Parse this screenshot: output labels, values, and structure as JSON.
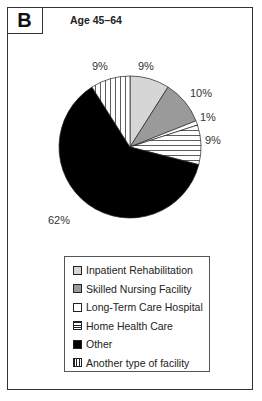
{
  "panel": {
    "label": "B",
    "title": "Age 45–64"
  },
  "chart_data": {
    "type": "pie",
    "title": "Age 45–64",
    "categories": [
      "Inpatient Rehabilitation",
      "Skilled Nursing Facility",
      "Long-Term Care Hospital",
      "Home Health Care",
      "Other",
      "Another type of facility"
    ],
    "values": [
      9,
      10,
      1,
      9,
      62,
      9
    ],
    "labels": [
      "9%",
      "10%",
      "1%",
      "9%",
      "62%",
      "9%"
    ],
    "fills": [
      "light-gray",
      "gray",
      "white",
      "horizontal-stripes",
      "black",
      "vertical-stripes"
    ],
    "colors": [
      "#d6d6d6",
      "#9a9a9a",
      "#ffffff",
      "#ffffff",
      "#000000",
      "#ffffff"
    ],
    "start_angle": "12 o'clock, clockwise",
    "legend_position": "bottom"
  },
  "legend": {
    "items": [
      {
        "label": "Inpatient Rehabilitation"
      },
      {
        "label": "Skilled Nursing Facility"
      },
      {
        "label": "Long-Term Care Hospital"
      },
      {
        "label": "Home Health Care"
      },
      {
        "label": "Other"
      },
      {
        "label": "Another type of facility"
      }
    ]
  }
}
